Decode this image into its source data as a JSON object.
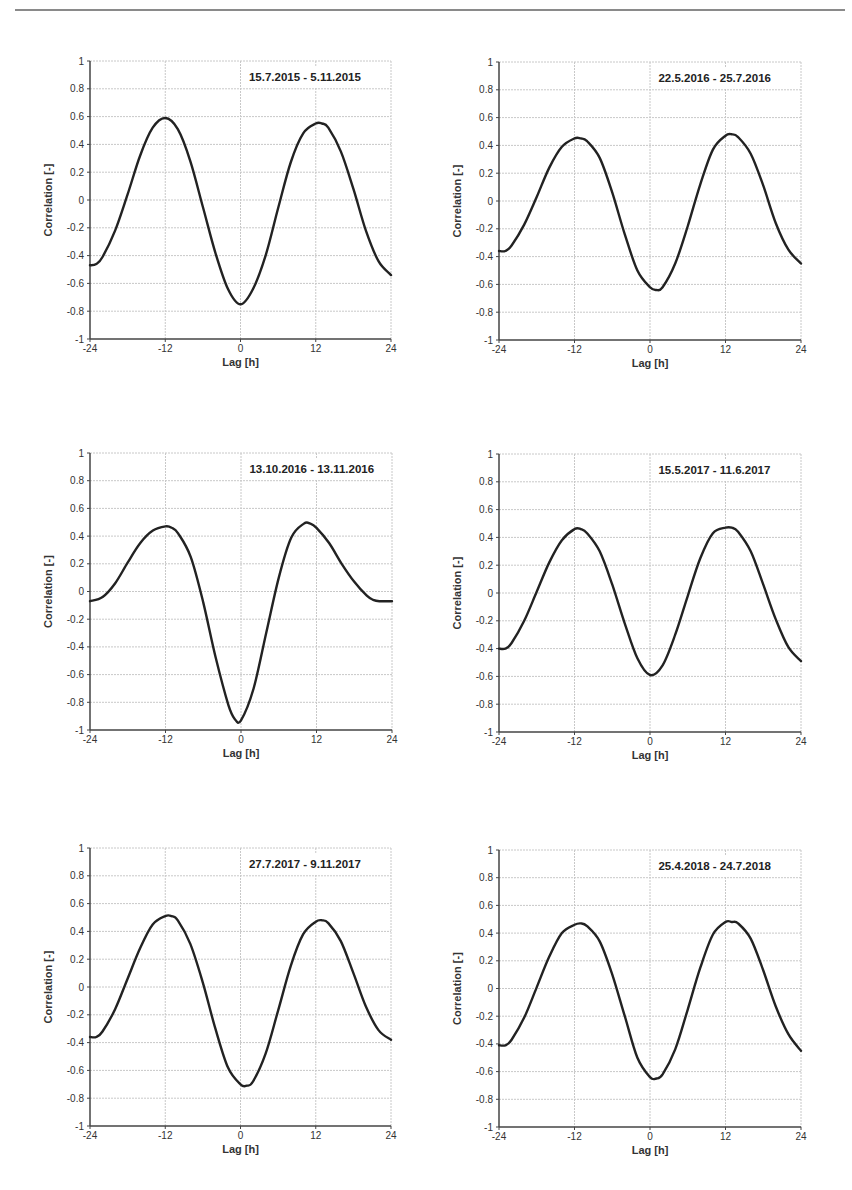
{
  "page": {
    "rule_color": "#8a8a8a"
  },
  "chart_data": [
    {
      "type": "line",
      "title": "15.7.2015 - 5.11.2015",
      "xlabel": "Lag [h]",
      "ylabel": "Correlation [-]",
      "xlim": [
        -24,
        24
      ],
      "ylim": [
        -1,
        1
      ],
      "xticks": [
        -24,
        -12,
        0,
        12,
        24
      ],
      "yticks": [
        1,
        0.8,
        0.6,
        0.4,
        0.2,
        0,
        -0.2,
        -0.4,
        -0.6,
        -0.8,
        -1
      ],
      "grid": true,
      "legend": null,
      "x": [
        -24,
        -23,
        -22,
        -20,
        -18,
        -16,
        -14,
        -12,
        -10,
        -8,
        -6,
        -4,
        -2,
        0,
        2,
        4,
        6,
        8,
        10,
        12,
        13,
        14,
        16,
        18,
        20,
        22,
        24
      ],
      "y": [
        -0.47,
        -0.46,
        -0.41,
        -0.22,
        0.04,
        0.32,
        0.52,
        0.59,
        0.51,
        0.28,
        -0.05,
        -0.38,
        -0.64,
        -0.75,
        -0.64,
        -0.4,
        -0.06,
        0.27,
        0.48,
        0.55,
        0.55,
        0.52,
        0.35,
        0.08,
        -0.22,
        -0.44,
        -0.54
      ]
    },
    {
      "type": "line",
      "title": "22.5.2016 - 25.7.2016",
      "xlabel": "Lag [h]",
      "ylabel": "Correlation [-]",
      "xlim": [
        -24,
        24
      ],
      "ylim": [
        -1,
        1
      ],
      "xticks": [
        -24,
        -12,
        0,
        12,
        24
      ],
      "yticks": [
        1,
        0.8,
        0.6,
        0.4,
        0.2,
        0,
        -0.2,
        -0.4,
        -0.6,
        -0.8,
        -1
      ],
      "grid": true,
      "legend": null,
      "x": [
        -24,
        -23,
        -22,
        -20,
        -18,
        -16,
        -14,
        -12,
        -11,
        -10,
        -8,
        -6,
        -4,
        -2,
        0,
        1,
        2,
        4,
        6,
        8,
        10,
        12,
        13,
        14,
        16,
        18,
        20,
        22,
        24
      ],
      "y": [
        -0.36,
        -0.36,
        -0.32,
        -0.17,
        0.03,
        0.24,
        0.39,
        0.45,
        0.45,
        0.43,
        0.31,
        0.06,
        -0.24,
        -0.5,
        -0.62,
        -0.64,
        -0.62,
        -0.45,
        -0.18,
        0.12,
        0.37,
        0.47,
        0.48,
        0.46,
        0.34,
        0.11,
        -0.16,
        -0.35,
        -0.45
      ]
    },
    {
      "type": "line",
      "title": "13.10.2016 - 13.11.2016",
      "xlabel": "Lag [h]",
      "ylabel": "Correlation [-]",
      "xlim": [
        -24,
        24
      ],
      "ylim": [
        -1,
        1
      ],
      "xticks": [
        -24,
        -12,
        0,
        12,
        24
      ],
      "yticks": [
        1,
        0.8,
        0.6,
        0.4,
        0.2,
        0,
        -0.2,
        -0.4,
        -0.6,
        -0.8,
        -1
      ],
      "grid": true,
      "legend": null,
      "x": [
        -24,
        -22,
        -20,
        -18,
        -16,
        -14,
        -12,
        -11,
        -10,
        -8,
        -6,
        -4,
        -2,
        -1,
        0,
        2,
        4,
        6,
        8,
        10,
        11,
        12,
        14,
        16,
        18,
        20,
        21,
        22,
        24
      ],
      "y": [
        -0.07,
        -0.04,
        0.06,
        0.21,
        0.35,
        0.44,
        0.47,
        0.46,
        0.42,
        0.25,
        -0.08,
        -0.48,
        -0.82,
        -0.92,
        -0.93,
        -0.7,
        -0.3,
        0.1,
        0.39,
        0.49,
        0.49,
        0.46,
        0.35,
        0.2,
        0.07,
        -0.03,
        -0.06,
        -0.07,
        -0.07
      ]
    },
    {
      "type": "line",
      "title": "15.5.2017 - 11.6.2017",
      "xlabel": "Lag [h]",
      "ylabel": "Correlation [-]",
      "xlim": [
        -24,
        24
      ],
      "ylim": [
        -1,
        1
      ],
      "xticks": [
        -24,
        -12,
        0,
        12,
        24
      ],
      "yticks": [
        1,
        0.8,
        0.6,
        0.4,
        0.2,
        0,
        -0.2,
        -0.4,
        -0.6,
        -0.8,
        -1
      ],
      "grid": true,
      "legend": null,
      "x": [
        -24,
        -23,
        -22,
        -20,
        -18,
        -16,
        -14,
        -12,
        -11,
        -10,
        -8,
        -6,
        -4,
        -2,
        0,
        2,
        4,
        6,
        8,
        10,
        12,
        13,
        14,
        16,
        18,
        20,
        22,
        24
      ],
      "y": [
        -0.4,
        -0.4,
        -0.36,
        -0.2,
        0.01,
        0.22,
        0.38,
        0.46,
        0.46,
        0.43,
        0.3,
        0.06,
        -0.22,
        -0.47,
        -0.59,
        -0.52,
        -0.3,
        -0.02,
        0.25,
        0.43,
        0.47,
        0.47,
        0.44,
        0.3,
        0.06,
        -0.19,
        -0.39,
        -0.49
      ]
    },
    {
      "type": "line",
      "title": "27.7.2017 - 9.11.2017",
      "xlabel": "Lag [h]",
      "ylabel": "Correlation [-]",
      "xlim": [
        -24,
        24
      ],
      "ylim": [
        -1,
        1
      ],
      "xticks": [
        -24,
        -12,
        0,
        12,
        24
      ],
      "yticks": [
        1,
        0.8,
        0.6,
        0.4,
        0.2,
        0,
        -0.2,
        -0.4,
        -0.6,
        -0.8,
        -1
      ],
      "grid": true,
      "legend": null,
      "x": [
        -24,
        -23,
        -22,
        -20,
        -18,
        -16,
        -14,
        -12,
        -11,
        -10,
        -8,
        -6,
        -4,
        -2,
        0,
        1,
        2,
        4,
        6,
        8,
        10,
        12,
        13,
        14,
        16,
        18,
        20,
        22,
        24
      ],
      "y": [
        -0.36,
        -0.36,
        -0.32,
        -0.16,
        0.06,
        0.28,
        0.45,
        0.51,
        0.51,
        0.48,
        0.31,
        0.03,
        -0.3,
        -0.58,
        -0.7,
        -0.71,
        -0.68,
        -0.48,
        -0.17,
        0.15,
        0.38,
        0.47,
        0.48,
        0.46,
        0.33,
        0.1,
        -0.14,
        -0.31,
        -0.38
      ]
    },
    {
      "type": "line",
      "title": "25.4.2018 - 24.7.2018",
      "xlabel": "Lag [h]",
      "ylabel": "Correlation [-]",
      "xlim": [
        -24,
        24
      ],
      "ylim": [
        -1,
        1
      ],
      "xticks": [
        -24,
        -12,
        0,
        12,
        24
      ],
      "yticks": [
        1,
        0.8,
        0.6,
        0.4,
        0.2,
        0,
        -0.2,
        -0.4,
        -0.6,
        -0.8,
        -1
      ],
      "grid": true,
      "legend": null,
      "x": [
        -24,
        -23,
        -22,
        -20,
        -18,
        -16,
        -14,
        -12,
        -11,
        -10,
        -8,
        -6,
        -4,
        -2,
        0,
        1,
        2,
        4,
        6,
        8,
        10,
        12,
        13,
        14,
        16,
        18,
        20,
        22,
        24
      ],
      "y": [
        -0.41,
        -0.41,
        -0.37,
        -0.21,
        0.01,
        0.23,
        0.4,
        0.46,
        0.47,
        0.45,
        0.34,
        0.1,
        -0.2,
        -0.5,
        -0.64,
        -0.65,
        -0.62,
        -0.44,
        -0.15,
        0.15,
        0.39,
        0.48,
        0.48,
        0.47,
        0.36,
        0.13,
        -0.13,
        -0.33,
        -0.45
      ]
    }
  ],
  "layout": {
    "panels": [
      {
        "left": 90,
        "top": 61,
        "right": 391,
        "bottom": 339
      },
      {
        "left": 499,
        "top": 62,
        "right": 801,
        "bottom": 340
      },
      {
        "left": 90,
        "top": 453,
        "right": 392,
        "bottom": 730
      },
      {
        "left": 499,
        "top": 454,
        "right": 801,
        "bottom": 732
      },
      {
        "left": 90,
        "top": 848,
        "right": 391,
        "bottom": 1126
      },
      {
        "left": 499,
        "top": 850,
        "right": 801,
        "bottom": 1127
      }
    ]
  }
}
